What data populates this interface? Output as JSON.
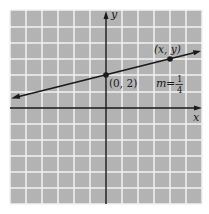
{
  "diagram": {
    "type": "coordinate-plane-line",
    "axes": {
      "x_label": "x",
      "y_label": "y"
    },
    "grid": {
      "cells_x": 12,
      "cells_y": 12,
      "origin_cell": [
        6,
        6
      ],
      "grid_color": "#f2f2f2",
      "background_color": "#b3b3b3"
    },
    "line": {
      "equation_slope_label_m": "m",
      "equation_slope_label_eq": "=",
      "slope_numerator": "1",
      "slope_denominator": "4",
      "color": "#1a1a1a"
    },
    "points": [
      {
        "label": "(0, 2)",
        "x": 0,
        "y": 2
      },
      {
        "label": "(x, y)",
        "x": 4,
        "y": 3
      }
    ]
  }
}
